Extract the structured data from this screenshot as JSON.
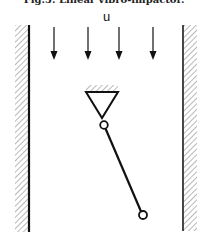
{
  "caption": "Fig.5. Linear vibro-impactor.",
  "flow_label": "u",
  "colors": {
    "line": "#111111",
    "hatch": "#8a8a8a",
    "background": "#ffffff"
  },
  "diagram": {
    "walls": [
      {
        "name": "left-wall",
        "x": 29,
        "y_top": 25,
        "y_bottom": 232,
        "hatch_side": "left"
      },
      {
        "name": "right-wall",
        "x": 183,
        "y_top": 25,
        "y_bottom": 231,
        "hatch_side": "right"
      }
    ],
    "flow_arrows": [
      {
        "x": 54,
        "y1": 27,
        "y2": 60
      },
      {
        "x": 88,
        "y1": 27,
        "y2": 60
      },
      {
        "x": 119,
        "y1": 27,
        "y2": 60
      },
      {
        "x": 153,
        "y1": 27,
        "y2": 60
      }
    ],
    "support": {
      "top_y": 92,
      "left_x": 86,
      "right_x": 118,
      "apex_x": 102,
      "apex_y": 118
    },
    "pivot": {
      "cx": 104,
      "cy": 125,
      "r": 3.8
    },
    "rod": {
      "x1": 106,
      "y1": 129,
      "x2": 141,
      "y2": 211
    },
    "mass": {
      "cx": 143,
      "cy": 215,
      "r": 4
    }
  }
}
